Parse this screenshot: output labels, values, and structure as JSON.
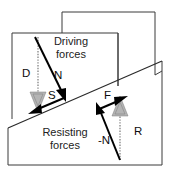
{
  "figure": {
    "width": 175,
    "height": 178,
    "background_color": "#ffffff"
  },
  "regions": [
    {
      "id": "driving",
      "label_line1": "Driving",
      "label_line2": "forces",
      "position": "upper"
    },
    {
      "id": "resisting",
      "label_line1": "Resisting",
      "label_line2": "forces",
      "position": "lower"
    }
  ],
  "vectors": [
    {
      "id": "D",
      "label": "D",
      "description": "driving weight component, vertical downward",
      "style": "dotted",
      "color": "#9a9a9a",
      "head": "hatched",
      "direction": "down"
    },
    {
      "id": "N",
      "label": "N",
      "description": "normal force component, down-right into slope",
      "style": "solid",
      "color": "#000000",
      "head": "solid",
      "direction": "down-right"
    },
    {
      "id": "S",
      "label": "S",
      "description": "shear force along slope, down-left",
      "style": "solid",
      "color": "#000000",
      "head": "solid",
      "direction": "down-left"
    },
    {
      "id": "F",
      "label": "F",
      "description": "frictional resisting force up the slope",
      "style": "solid",
      "color": "#000000",
      "head": "solid",
      "direction": "up-right"
    },
    {
      "id": "-N",
      "label": "-N",
      "description": "reaction normal force, up-left",
      "style": "solid",
      "color": "#000000",
      "head": "solid",
      "direction": "up-left"
    },
    {
      "id": "R",
      "label": "R",
      "description": "resultant resisting force, vertical upward",
      "style": "dotted",
      "color": "#9a9a9a",
      "head": "hatched",
      "direction": "up"
    }
  ],
  "geometry": {
    "slope_left_x": 8,
    "slope_left_y": 128,
    "slope_right_x": 162,
    "slope_right_y": 61,
    "frame_stroke": "#3a3a3a"
  }
}
